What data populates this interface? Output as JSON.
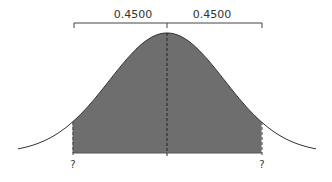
{
  "diagram": {
    "left_area_label": "0.4500",
    "right_area_label": "0.4500",
    "left_bound_label": "?",
    "right_bound_label": "?",
    "shade_color": "#6e6e6e",
    "line_color": "#333333",
    "shade_z": 1.645
  }
}
